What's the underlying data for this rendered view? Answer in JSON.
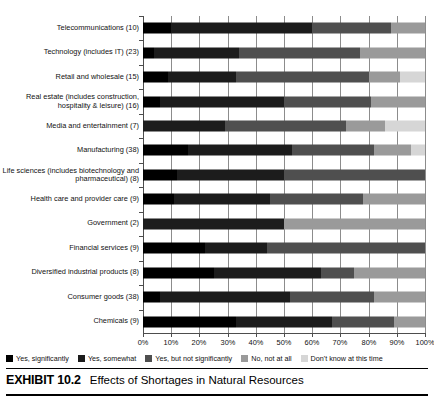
{
  "caption": {
    "number": "EXHIBIT 10.2",
    "text": "Effects of Shortages in Natural Resources"
  },
  "axis": {
    "ticks": [
      "0%",
      "10%",
      "20%",
      "30%",
      "40%",
      "50%",
      "60%",
      "70%",
      "80%",
      "90%",
      "100%"
    ]
  },
  "legend": [
    {
      "label": "Yes, significantly",
      "color": "#000000"
    },
    {
      "label": "Yes, somewhat",
      "color": "#1c1c1c"
    },
    {
      "label": "Yes, but not significantly",
      "color": "#4f4f4f"
    },
    {
      "label": "No, not at all",
      "color": "#9a9a9a"
    },
    {
      "label": "Don't know at this time",
      "color": "#d6d6d6"
    }
  ],
  "chart_data": {
    "type": "bar",
    "title": "Effects of Shortages in Natural Resources",
    "subtype": "stacked-horizontal-100-percent",
    "xlabel": "",
    "ylabel": "",
    "xlim": [
      0,
      100
    ],
    "grid": true,
    "legend_position": "bottom",
    "categories": [
      "Telecommunications (10)",
      "Technology (includes IT) (23)",
      "Retail and wholesale (15)",
      "Real estate (includes construction, hospitality & leisure) (16)",
      "Media and entertainment (7)",
      "Manufacturing (38)",
      "Life sciences (includes biotechnology and pharmaceutical) (8)",
      "Health care and provider care (9)",
      "Government (2)",
      "Financial services (9)",
      "Diversified industrial products (8)",
      "Consumer goods (38)",
      "Chemicals (9)"
    ],
    "series": [
      {
        "name": "Yes, significantly",
        "color": "#000000",
        "values": [
          10,
          4,
          9,
          6,
          0,
          16,
          12,
          11,
          0,
          22,
          25,
          6,
          33
        ]
      },
      {
        "name": "Yes, somewhat",
        "color": "#1c1c1c",
        "values": [
          50,
          30,
          24,
          44,
          29,
          37,
          38,
          34,
          50,
          22,
          38,
          46,
          34
        ]
      },
      {
        "name": "Yes, but not significantly",
        "color": "#4f4f4f",
        "values": [
          28,
          43,
          47,
          31,
          43,
          29,
          50,
          33,
          0,
          56,
          12,
          30,
          22
        ]
      },
      {
        "name": "No, not at all",
        "color": "#9a9a9a",
        "values": [
          12,
          23,
          11,
          19,
          14,
          13,
          0,
          22,
          50,
          0,
          25,
          18,
          11
        ]
      },
      {
        "name": "Don't know at this time",
        "color": "#d6d6d6",
        "values": [
          0,
          0,
          9,
          0,
          14,
          5,
          0,
          0,
          0,
          0,
          0,
          0,
          0
        ]
      }
    ]
  }
}
